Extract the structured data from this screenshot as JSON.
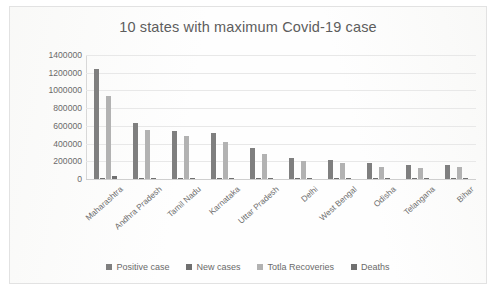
{
  "chart_data": {
    "type": "bar",
    "title": "10 states with maximum Covid-19 case",
    "xlabel": "",
    "ylabel": "",
    "ylim": [
      0,
      1400000
    ],
    "ytick_values": [
      0,
      200000,
      400000,
      600000,
      800000,
      1000000,
      1200000,
      1400000
    ],
    "ytick_labels": [
      "0",
      "200000",
      "400000",
      "600000",
      "800000",
      "1000000",
      "1200000",
      "1400000"
    ],
    "grid": true,
    "legend_position": "bottom",
    "categories": [
      "Maharashtra",
      "Andhra Pradesh",
      "Tamil Nadu",
      "Karnataka",
      "Uttar Pradesh",
      "Delhi",
      "West Bengal",
      "Odisha",
      "Telangana",
      "Bihar"
    ],
    "series": [
      {
        "name": "Positive case",
        "color": "#7f7f7f",
        "values": [
          1240000,
          635000,
          545000,
          520000,
          350000,
          235000,
          215000,
          180000,
          155000,
          155000
        ]
      },
      {
        "name": "New cases",
        "color": "#6f6f6f",
        "values": [
          14000,
          7000,
          5500,
          8000,
          4500,
          3500,
          3200,
          3000,
          2200,
          1500
        ]
      },
      {
        "name": "Totla Recoveries",
        "color": "#b2b2b2",
        "values": [
          940000,
          555000,
          485000,
          420000,
          285000,
          205000,
          180000,
          140000,
          130000,
          140000
        ]
      },
      {
        "name": "Deaths",
        "color": "#707070",
        "values": [
          33000,
          5500,
          9000,
          8000,
          5000,
          4800,
          4100,
          700,
          950,
          800
        ]
      }
    ]
  },
  "legend": {
    "items": [
      {
        "label": "Positive case",
        "color": "#7f7f7f"
      },
      {
        "label": "New cases",
        "color": "#6f6f6f"
      },
      {
        "label": "Totla Recoveries",
        "color": "#b2b2b2"
      },
      {
        "label": "Deaths",
        "color": "#707070"
      }
    ]
  }
}
